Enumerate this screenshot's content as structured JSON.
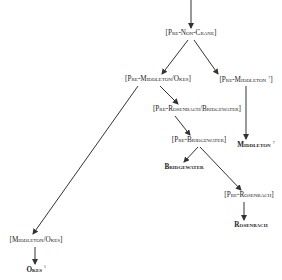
{
  "diagram": {
    "title": "",
    "nodes": [
      {
        "id": "pre-non-crane",
        "label": "[Pre-Non-Crane]",
        "type": "hypothetical",
        "x": 191,
        "y": 34
      },
      {
        "id": "pre-middleton-okes",
        "label": "[Pre-Middleton/Okes]",
        "type": "hypothetical",
        "x": 158,
        "y": 80
      },
      {
        "id": "pre-middleton",
        "label": "[Pre-Middleton",
        "sup": "?",
        "close": "]",
        "type": "hypothetical",
        "x": 246,
        "y": 80
      },
      {
        "id": "pre-rosenbach-bridgewater",
        "label": "[Pre-Rosenbach/Bridgewater]",
        "type": "hypothetical",
        "x": 197,
        "y": 110
      },
      {
        "id": "pre-bridgewater",
        "label": "[Pre-Bridgewater]",
        "type": "hypothetical",
        "x": 199,
        "y": 141
      },
      {
        "id": "middleton",
        "label": "Middleton",
        "sup": "?",
        "type": "manuscript",
        "x": 256,
        "y": 145
      },
      {
        "id": "bridgewater",
        "label": "Bridgewater",
        "type": "manuscript",
        "x": 184,
        "y": 167
      },
      {
        "id": "pre-rosenbach",
        "label": "[Pre-Rosenbach]",
        "type": "hypothetical",
        "x": 249,
        "y": 196
      },
      {
        "id": "rosenbach",
        "label": "Rosenbach",
        "type": "manuscript",
        "x": 251,
        "y": 226
      },
      {
        "id": "middleton-okes",
        "label": "[Middleton/Okes]",
        "type": "hypothetical",
        "x": 36,
        "y": 241
      },
      {
        "id": "okes",
        "label": "Okes",
        "sup": "¹",
        "type": "manuscript",
        "x": 36,
        "y": 270
      }
    ],
    "edges": [
      {
        "from": "top",
        "to": "pre-non-crane",
        "x1": 191,
        "y1": 0,
        "x2": 191,
        "y2": 28
      },
      {
        "from": "pre-non-crane",
        "to": "pre-middleton-okes",
        "x1": 188,
        "y1": 40,
        "x2": 162,
        "y2": 74
      },
      {
        "from": "pre-non-crane",
        "to": "pre-middleton",
        "x1": 194,
        "y1": 40,
        "x2": 218,
        "y2": 74
      },
      {
        "from": "pre-middleton-okes",
        "to": "pre-rosenbach-bridgewater",
        "x1": 160,
        "y1": 86,
        "x2": 178,
        "y2": 104
      },
      {
        "from": "pre-middleton-okes",
        "to": "middleton-okes",
        "x1": 138,
        "y1": 86,
        "x2": 33,
        "y2": 234
      },
      {
        "from": "pre-middleton",
        "to": "middleton",
        "x1": 246,
        "y1": 86,
        "x2": 246,
        "y2": 139
      },
      {
        "from": "pre-rosenbach-bridgewater",
        "to": "pre-bridgewater",
        "x1": 175,
        "y1": 116,
        "x2": 190,
        "y2": 135
      },
      {
        "from": "pre-bridgewater",
        "to": "bridgewater",
        "x1": 198,
        "y1": 147,
        "x2": 184,
        "y2": 162
      },
      {
        "from": "pre-bridgewater",
        "to": "pre-rosenbach",
        "x1": 200,
        "y1": 147,
        "x2": 241,
        "y2": 190
      },
      {
        "from": "pre-rosenbach",
        "to": "rosenbach",
        "x1": 244,
        "y1": 202,
        "x2": 244,
        "y2": 220
      },
      {
        "from": "middleton-okes",
        "to": "okes",
        "x1": 35,
        "y1": 247,
        "x2": 35,
        "y2": 264
      }
    ],
    "colors": {
      "line": "#333333",
      "text": "#222222",
      "background": "#ffffff"
    }
  }
}
